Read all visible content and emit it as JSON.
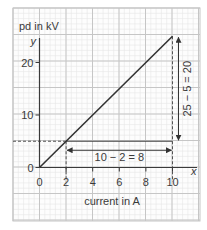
{
  "chart_data": {
    "type": "line",
    "title": "",
    "xlabel": "current in A",
    "ylabel": "pd in kV",
    "x_axis_var": "x",
    "y_axis_var": "y",
    "xlim": [
      0,
      10
    ],
    "ylim": [
      0,
      25
    ],
    "grid": true,
    "x_ticks": [
      0,
      2,
      4,
      6,
      8,
      10
    ],
    "x_tick_labels": [
      "0",
      "2",
      "4",
      "6",
      "8",
      "10"
    ],
    "y_ticks": [
      0,
      10,
      20
    ],
    "y_tick_labels": [
      "0",
      "10",
      "20"
    ],
    "series": [
      {
        "name": "pd vs current",
        "x": [
          0,
          10
        ],
        "y": [
          0,
          25
        ],
        "color": "#333333"
      }
    ],
    "annotations": {
      "horizontal_run": {
        "from": [
          2,
          5
        ],
        "to": [
          10,
          5
        ],
        "label": "10 − 2 = 8"
      },
      "vertical_rise": {
        "from": [
          10,
          5
        ],
        "to": [
          10,
          25
        ],
        "label": "25 − 5 = 20"
      },
      "guide_point_low": [
        2,
        5
      ],
      "guide_point_high": [
        10,
        25
      ]
    },
    "colors": {
      "line": "#333333",
      "axis": "#3a3a3a",
      "grid_major": "#c6c6c6",
      "grid_minor": "#e6e6e6"
    }
  }
}
